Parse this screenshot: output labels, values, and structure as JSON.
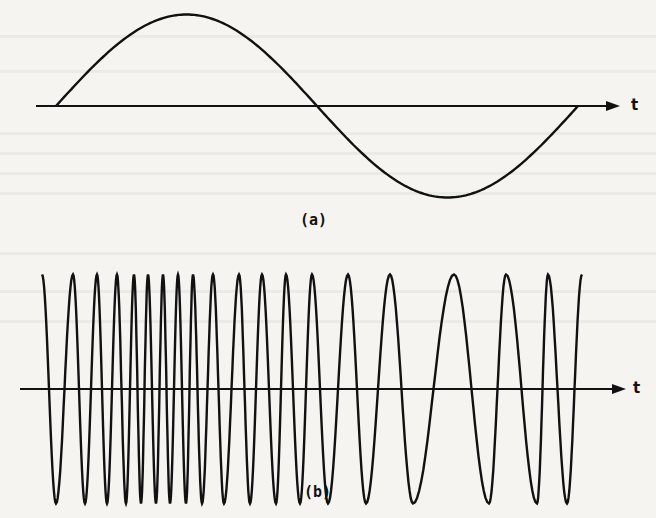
{
  "figure": {
    "panel_a": {
      "label": "(a)",
      "axis_label": "t",
      "description": "single cycle sine wave of constant frequency"
    },
    "panel_b": {
      "label": "(b)",
      "axis_label": "t",
      "description": "oscillation with time-varying frequency: high frequency at left, decreasing to minimum near the right, then rising again"
    },
    "colors": {
      "ink": "#111111",
      "paper": "#f5f4f1",
      "bleed_through": "#e4e3df"
    }
  },
  "chart_data": [
    {
      "type": "line",
      "title": "(a)",
      "xlabel": "t",
      "ylabel": "",
      "grid": false,
      "series": [
        {
          "name": "sine",
          "cycles": 1,
          "start_phase": 0
        }
      ],
      "axis_y_px": 106,
      "wave": {
        "x_start": 56,
        "x_end": 578,
        "peak_y": 17,
        "trough_y": 200
      }
    },
    {
      "type": "line",
      "title": "(b)",
      "xlabel": "t",
      "ylabel": "",
      "grid": false,
      "series": [
        {
          "name": "variable-frequency oscillation"
        }
      ],
      "axis_y_px": 389,
      "peak_y": 276,
      "trough_y": 505,
      "extrema_x": [
        42,
        56,
        73,
        85,
        97,
        107,
        117,
        126,
        134,
        141,
        148,
        156,
        163,
        170,
        178,
        186,
        193,
        202,
        213,
        224,
        239,
        250,
        262,
        276,
        286,
        300,
        312,
        328,
        348,
        366,
        390,
        413,
        454,
        489,
        506,
        537,
        548,
        567,
        582
      ],
      "extrema_kind_start": "peak"
    }
  ]
}
